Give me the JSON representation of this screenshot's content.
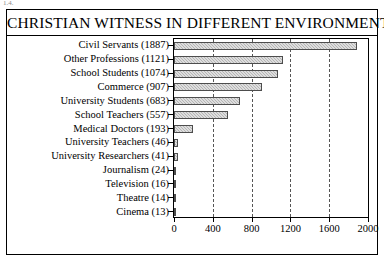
{
  "page": {
    "top_fragment": "1.4."
  },
  "figure": {
    "title": "CHRISTIAN WITNESS IN DIFFERENT ENVIRONMENTS"
  },
  "chart_data": {
    "type": "bar",
    "orientation": "horizontal",
    "title": "CHRISTIAN WITNESS IN DIFFERENT ENVIRONMENTS",
    "xlabel": "",
    "ylabel": "",
    "categories": [
      "Civil Servants (1887)",
      "Other Professions (1121)",
      "School Students (1074)",
      "Commerce (907)",
      "University Students (683)",
      "School Teachers (557)",
      "Medical Doctors (193)",
      "University Teachers (46)",
      "University Researchers (41)",
      "Journalism (24)",
      "Television (16)",
      "Theatre (14)",
      "Cinema (13)"
    ],
    "category_names": [
      "Civil Servants",
      "Other Professions",
      "School Students",
      "Commerce",
      "University Students",
      "School Teachers",
      "Medical Doctors",
      "University Teachers",
      "University Researchers",
      "Journalism",
      "Television",
      "Theatre",
      "Cinema"
    ],
    "values": [
      1887,
      1121,
      1074,
      907,
      683,
      557,
      193,
      46,
      41,
      24,
      16,
      14,
      13
    ],
    "xlim": [
      0,
      2000
    ],
    "xticks": [
      0,
      400,
      800,
      1200,
      1600,
      2000
    ],
    "xtick_labels": [
      "0",
      "400",
      "800",
      "1200",
      "1600",
      "2000"
    ],
    "grid": "vertical-dashed",
    "legend": "none",
    "bar_fill": "#b5b5b5",
    "bar_edge": "#4d4d4d"
  }
}
